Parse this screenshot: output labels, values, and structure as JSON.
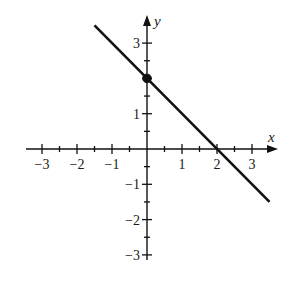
{
  "chart_data": {
    "type": "line",
    "title": "",
    "xlabel": "x",
    "ylabel": "y",
    "xlim": [
      -3.4,
      3.8
    ],
    "ylim": [
      -3.2,
      3.8
    ],
    "grid": false,
    "legend": null,
    "x_ticks": [
      -3,
      -2,
      -1,
      1,
      2,
      3
    ],
    "y_ticks": [
      -3,
      -2,
      -1,
      1,
      3
    ],
    "x_tick_labels": [
      "−3",
      "−2",
      "−1",
      "1",
      "2",
      "3"
    ],
    "y_tick_labels": [
      "−3",
      "−2",
      "−1",
      "1",
      "3"
    ],
    "minor_tick_step": 0.5,
    "series": [
      {
        "name": "y = -x + 2",
        "x": [
          -1.5,
          3.5
        ],
        "y": [
          3.5,
          -1.5
        ],
        "color": "#111111"
      }
    ],
    "points": [
      {
        "label": "y-intercept",
        "x": 0,
        "y": 2,
        "filled": true
      }
    ]
  },
  "colors": {
    "ink": "#111111",
    "background": "#ffffff"
  }
}
